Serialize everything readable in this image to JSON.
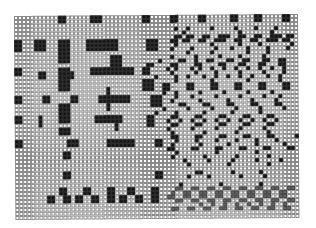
{
  "figure": {
    "type": "binary cell grid pattern",
    "columns": 71,
    "rows": 51,
    "cell_px": 4,
    "colors": {
      "empty": "#ffffff",
      "filled": "#111111",
      "marked": "#6a6a6a",
      "border": "#8a8a8a"
    },
    "legend": {
      ".": "empty",
      "#": "filled",
      "x": "x-marked"
    },
    "rows_data": [
      "...........##......###..........##.....##.....##......##....##.....##..",
      "...........##......###..........##.....##.....##......##....##.....##..",
      ".......................................................................",
      "........................................#..#.....#.....#....#....#.....",
      "..........................................#.............#.......#......",
      "........................................##.##..##..###..##..##..###.##.",
      "##...###...###....########.......###...##.##..##..###..##..##..###.##..",
      "##...###...###....########.......###....#........#......#....#.......#.",
      "##...###...###....########.......###...#....#.....#...#...#....#....#..",
      "...........###.............................#.....#........#....#.......",
      "...........###..........###............#.....#.....#....#.....#........",
      "...........###..........###.........#....##..#..##...##..##...##..##...",
      "........................###......##....##....##....##...##...##...##...",
      "##.........###.....###########..##....#.#...#.#..#..#..#..#..#..#..#...",
      "##....##...####....###########..##.....#.....#....#.....#.....#....#...",
      "......##...####....................#....#..#...#..#..#..#..#...#..#....",
      "...........###..................###.....#........#........#.......#....",
      "...........###..................###..##....##....##....##....##....##..",
      "...........###.........#........###..##....##....##....##....##....##..",
      ".......................#.............#..#.....#.....#.....#.....#......",
      "##.....##.....##.....########.....###...#...#.....#.....#.....#...#....",
      "##.....##.....##.....########.....###..#......#......#.....#.....#.....",
      "...........###.........#..........###....##....##....##....##....##....",
      "...........###.........#.............#.....#.....#.....#.....#.....#...",
      "...........###.....................#....#......#......#......#.........",
      "##....#....###......#######......##....##....##....##....##....##......",
      "##....#....###......#######......##...#..#..#..#..#..#..#..#..#..#.....",
      "......#..................#.......##....##....##....##....##....##......",
      "...........###...........#............#.....#.....#.....#.....#........",
      "...........###.........................#.......#.......#.......#.......",
      ".......................................##....##....##....##....##.....#",
      "##...........###.......#######.....##...#....#....#....#....#....#.....",
      "##...........###.......#######.....##..#......#......#......#......#...",
      "......................................##....##....##....##....##....##.",
      "............##..........................#.........#.........#..........",
      "............##.........................#.......#.......#.......#.......",
      "..........................................#.....#.....#.....#.....#....",
      "...........................................#.........#.........#.......",
      ".......................................................................",
      "............##.....................##........##.......#......#.........",
      "............##.....................##......#....#.......#.....#........",
      ".......................................................................",
      ".........................................#.........#.........#.........",
      "...........##....##....##...##....##....xx..xx..xx..xx..xx..xx..xx..xx.",
      "...........##....##....##...##....##...x..xx..xx..xx..xx..xx..xx..xx...",
      "........##..##.##..##..##.##..##..##..xx..xx..xx..xx..xx..xx..xx..xx...",
      "........##..##.##..##..##.##..##..##....xx..xx..xx..xx..xx..xx..xx..xx.",
      "..............................................x..x..x..x..x..x..x..x..",
      ".......................................xx..xx..xx..xx..xx..xx..xx..xx..",
      ".......................................................................",
      "......................................................................."
    ]
  }
}
